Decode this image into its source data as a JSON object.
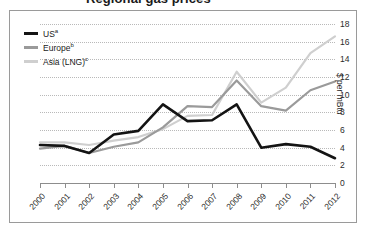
{
  "chart": {
    "title": "Regional gas prices",
    "ylabel": "$ per mBtu"
  },
  "legend": [
    {
      "label": "US",
      "note": "a",
      "color": "#141414",
      "name": "us"
    },
    {
      "label": "Europe",
      "note": "b",
      "color": "#9a9a9a",
      "name": "europe"
    },
    {
      "label": "Asia (LNG)",
      "note": "c",
      "color": "#cfcfcf",
      "name": "asia-lng"
    }
  ],
  "chart_data": {
    "type": "line",
    "title": "Regional gas prices",
    "xlabel": "",
    "ylabel": "$ per mBtu",
    "ylim": [
      0,
      18
    ],
    "yticks": [
      0,
      2,
      4,
      6,
      8,
      10,
      12,
      14,
      16,
      18
    ],
    "grid": true,
    "legend_position": "top-left",
    "categories": [
      2000,
      2001,
      2002,
      2003,
      2004,
      2005,
      2006,
      2007,
      2008,
      2009,
      2010,
      2011,
      2012
    ],
    "x": [
      "2000",
      "2001",
      "2002",
      "2003",
      "2004",
      "2005",
      "2006",
      "2007",
      "2008",
      "2009",
      "2010",
      "2011",
      "2012"
    ],
    "series": [
      {
        "name": "US",
        "color": "#141414",
        "values": [
          4.3,
          4.2,
          3.4,
          5.5,
          5.9,
          8.9,
          7.0,
          7.1,
          8.9,
          4.0,
          4.4,
          4.1,
          2.8
        ]
      },
      {
        "name": "Europe",
        "color": "#9a9a9a",
        "values": [
          3.9,
          4.2,
          3.4,
          4.1,
          4.6,
          6.3,
          8.7,
          8.6,
          11.6,
          8.7,
          8.2,
          10.5,
          11.5
        ]
      },
      {
        "name": "Asia (LNG)",
        "color": "#cfcfcf",
        "values": [
          4.6,
          4.6,
          4.3,
          4.8,
          5.2,
          6.1,
          7.6,
          7.7,
          12.6,
          9.1,
          10.8,
          14.7,
          16.6
        ]
      }
    ]
  }
}
